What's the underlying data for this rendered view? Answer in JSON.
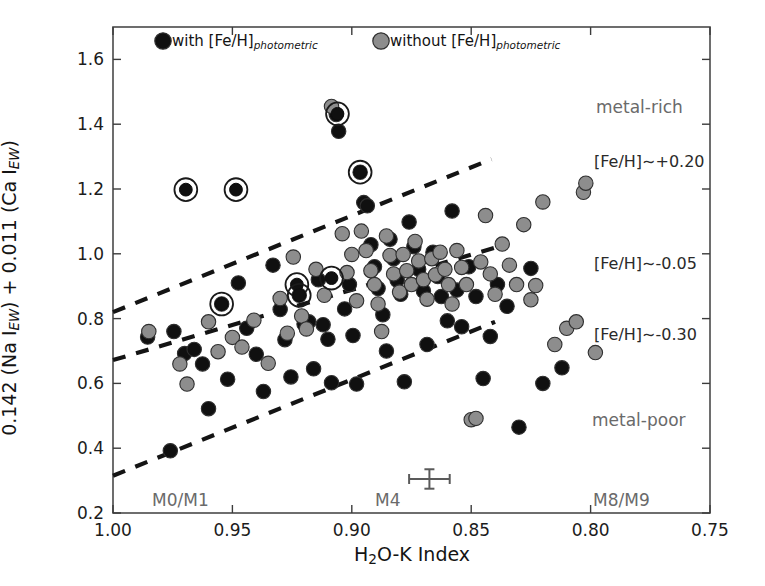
{
  "figure": {
    "background": "#ffffff",
    "frame_color": "#4a4a4a"
  },
  "axes": {
    "x_title_parts": {
      "pre": "H",
      "sub": "2",
      "post": "O-K Index"
    },
    "x_title_plain": "H2O-K Index",
    "y_title_plain": "0.142 (Na I_EW) + 0.011 (Ca I_EW)",
    "y_title_parts": {
      "a": "0.142 (Na I",
      "b": "EW",
      "c": ") + 0.011 (Ca I",
      "d": "EW",
      "e": ")"
    },
    "x_ticks": [
      "1.00",
      "0.95",
      "0.90",
      "0.85",
      "0.80",
      "0.75"
    ],
    "y_ticks": [
      "0.2",
      "0.4",
      "0.6",
      "0.8",
      "1.0",
      "1.2",
      "1.4",
      "1.6"
    ]
  },
  "legend": {
    "entries": [
      {
        "label_pre": "with [Fe/H]",
        "label_sub": "photometric",
        "marker": "black-filled-circle",
        "color": "#101010"
      },
      {
        "label_pre": "without [Fe/H]",
        "label_sub": "photometric",
        "marker": "gray-filled-circle",
        "color": "#8d8d8d"
      }
    ]
  },
  "annotations": [
    {
      "name": "metal-rich-label",
      "text": "metal-rich",
      "x": 596,
      "y": 97,
      "color": "#6a6a6a"
    },
    {
      "name": "metal-poor-label",
      "text": "metal-poor",
      "x": 592,
      "y": 410,
      "color": "#6a6a6a"
    },
    {
      "name": "spectral-m0m1-label",
      "text": "M0/M1",
      "x": 152,
      "y": 490,
      "color": "#6a6a6a"
    },
    {
      "name": "spectral-m4-label",
      "text": "M4",
      "x": 375,
      "y": 490,
      "color": "#6a6a6a"
    },
    {
      "name": "spectral-m8m9-label",
      "text": "M8/M9",
      "x": 593,
      "y": 490,
      "color": "#6a6a6a"
    },
    {
      "name": "feh-high-label",
      "text": "[Fe/H]∼+0.20",
      "x": 594,
      "y": 152,
      "color": "#2a2a2a"
    },
    {
      "name": "feh-mid-label",
      "text": "[Fe/H]∼-0.05",
      "x": 594,
      "y": 254,
      "color": "#2a2a2a"
    },
    {
      "name": "feh-low-label",
      "text": "[Fe/H]∼-0.30",
      "x": 594,
      "y": 325,
      "color": "#2a2a2a"
    }
  ],
  "errorbar": {
    "name": "typical-error-cross",
    "x": 0.8675,
    "y": 0.305,
    "xerr": 0.0085,
    "yerr": 0.03
  },
  "chart_data": {
    "type": "scatter",
    "title": "",
    "xlabel": "H2O-K Index",
    "ylabel": "0.142 (Na I_EW) + 0.011 (Ca I_EW)",
    "xlim": [
      1.0,
      0.75
    ],
    "ylim": [
      0.2,
      1.7
    ],
    "x_inverted": true,
    "grid": false,
    "legend_position": "top-inside",
    "xticks": [
      1.0,
      0.95,
      0.9,
      0.85,
      0.8,
      0.75
    ],
    "yticks": [
      0.2,
      0.4,
      0.6,
      0.8,
      1.0,
      1.2,
      1.4,
      1.6
    ],
    "series": [
      {
        "name": "with [Fe/H]photometric",
        "marker": "filled-circle",
        "color": "#101010",
        "points": [
          [
            0.9855,
            0.743
          ],
          [
            0.976,
            0.392
          ],
          [
            0.9745,
            0.76
          ],
          [
            0.97,
            0.692
          ],
          [
            0.966,
            0.705
          ],
          [
            0.9625,
            0.66
          ],
          [
            0.96,
            0.522
          ],
          [
            0.9545,
            0.845
          ],
          [
            0.952,
            0.613
          ],
          [
            0.9475,
            0.91
          ],
          [
            0.944,
            0.77
          ],
          [
            0.94,
            0.69
          ],
          [
            0.937,
            0.575
          ],
          [
            0.933,
            0.965
          ],
          [
            0.93,
            0.828
          ],
          [
            0.928,
            0.735
          ],
          [
            0.9255,
            0.62
          ],
          [
            0.922,
            0.872
          ],
          [
            0.92,
            0.783
          ],
          [
            0.918,
            0.79
          ],
          [
            0.916,
            0.645
          ],
          [
            0.914,
            0.92
          ],
          [
            0.912,
            0.781
          ],
          [
            0.91,
            0.736
          ],
          [
            0.9085,
            0.602
          ],
          [
            0.9065,
            1.43
          ],
          [
            0.9055,
            1.378
          ],
          [
            0.903,
            0.83
          ],
          [
            0.901,
            0.905
          ],
          [
            0.8995,
            0.748
          ],
          [
            0.898,
            0.598
          ],
          [
            0.8965,
            1.252
          ],
          [
            0.895,
            1.158
          ],
          [
            0.8935,
            1.148
          ],
          [
            0.892,
            1.028
          ],
          [
            0.8905,
            0.96
          ],
          [
            0.889,
            0.893
          ],
          [
            0.887,
            0.812
          ],
          [
            0.8855,
            0.7
          ],
          [
            0.884,
            1.045
          ],
          [
            0.8825,
            0.985
          ],
          [
            0.881,
            0.918
          ],
          [
            0.8795,
            0.875
          ],
          [
            0.878,
            0.605
          ],
          [
            0.876,
            1.098
          ],
          [
            0.874,
            1.022
          ],
          [
            0.872,
            0.952
          ],
          [
            0.87,
            0.885
          ],
          [
            0.8685,
            0.72
          ],
          [
            0.866,
            1.005
          ],
          [
            0.864,
            0.93
          ],
          [
            0.8625,
            0.868
          ],
          [
            0.86,
            0.793
          ],
          [
            0.858,
            1.132
          ],
          [
            0.856,
            0.888
          ],
          [
            0.854,
            0.775
          ],
          [
            0.851,
            0.96
          ],
          [
            0.848,
            0.868
          ],
          [
            0.845,
            0.615
          ],
          [
            0.842,
            0.745
          ],
          [
            0.839,
            0.905
          ],
          [
            0.835,
            0.838
          ],
          [
            0.83,
            0.465
          ],
          [
            0.825,
            0.955
          ],
          [
            0.82,
            0.6
          ],
          [
            0.812,
            0.648
          ]
        ]
      },
      {
        "name": "without [Fe/H]photometric",
        "marker": "filled-circle",
        "color": "#8d8d8d",
        "points": [
          [
            0.985,
            0.76
          ],
          [
            0.972,
            0.66
          ],
          [
            0.969,
            0.598
          ],
          [
            0.96,
            0.79
          ],
          [
            0.956,
            0.698
          ],
          [
            0.95,
            0.742
          ],
          [
            0.946,
            0.712
          ],
          [
            0.941,
            0.795
          ],
          [
            0.935,
            0.662
          ],
          [
            0.93,
            0.862
          ],
          [
            0.927,
            0.755
          ],
          [
            0.9245,
            0.99
          ],
          [
            0.921,
            0.808
          ],
          [
            0.919,
            0.768
          ],
          [
            0.915,
            0.952
          ],
          [
            0.9115,
            0.872
          ],
          [
            0.9085,
            1.455
          ],
          [
            0.904,
            1.062
          ],
          [
            0.902,
            0.942
          ],
          [
            0.9,
            0.998
          ],
          [
            0.898,
            0.855
          ],
          [
            0.896,
            1.07
          ],
          [
            0.894,
            1.01
          ],
          [
            0.892,
            0.948
          ],
          [
            0.8905,
            0.905
          ],
          [
            0.889,
            0.845
          ],
          [
            0.8875,
            0.76
          ],
          [
            0.8855,
            1.055
          ],
          [
            0.884,
            0.995
          ],
          [
            0.8825,
            0.938
          ],
          [
            0.88,
            0.882
          ],
          [
            0.8785,
            0.998
          ],
          [
            0.877,
            0.948
          ],
          [
            0.875,
            0.905
          ],
          [
            0.8735,
            1.038
          ],
          [
            0.872,
            0.978
          ],
          [
            0.87,
            0.92
          ],
          [
            0.8685,
            0.86
          ],
          [
            0.8665,
            0.985
          ],
          [
            0.865,
            0.935
          ],
          [
            0.863,
            1.005
          ],
          [
            0.861,
            0.952
          ],
          [
            0.8595,
            0.905
          ],
          [
            0.858,
            0.845
          ],
          [
            0.856,
            1.01
          ],
          [
            0.854,
            0.958
          ],
          [
            0.852,
            0.905
          ],
          [
            0.85,
            0.488
          ],
          [
            0.848,
            0.492
          ],
          [
            0.846,
            0.975
          ],
          [
            0.844,
            1.118
          ],
          [
            0.842,
            0.938
          ],
          [
            0.84,
            0.875
          ],
          [
            0.837,
            1.03
          ],
          [
            0.834,
            0.965
          ],
          [
            0.831,
            0.905
          ],
          [
            0.828,
            1.09
          ],
          [
            0.825,
            0.858
          ],
          [
            0.823,
            0.902
          ],
          [
            0.82,
            1.16
          ],
          [
            0.815,
            0.72
          ],
          [
            0.81,
            0.77
          ],
          [
            0.806,
            0.79
          ],
          [
            0.803,
            1.19
          ],
          [
            0.802,
            1.218
          ],
          [
            0.798,
            0.695
          ]
        ]
      },
      {
        "name": "circled-highlight",
        "marker": "circled-filled-circle",
        "color": "#101010",
        "points": [
          [
            0.9485,
            1.198
          ],
          [
            0.9695,
            1.198
          ],
          [
            0.9545,
            0.845
          ],
          [
            0.8965,
            1.252
          ],
          [
            0.906,
            1.432
          ],
          [
            0.923,
            0.905
          ],
          [
            0.922,
            0.872
          ],
          [
            0.9085,
            0.925
          ]
        ]
      }
    ],
    "trend_lines": [
      {
        "name": "feh-high-line",
        "label": "[Fe/H]~+0.20",
        "x1": 1.0,
        "y1": 0.82,
        "x2": 0.8415,
        "y2": 1.292,
        "style": "dashed",
        "color": "#141414"
      },
      {
        "name": "feh-mid-line",
        "label": "[Fe/H]~-0.05",
        "x1": 1.0,
        "y1": 0.672,
        "x2": 0.8395,
        "y2": 1.02,
        "style": "dashed",
        "color": "#141414"
      },
      {
        "name": "feh-low-line",
        "label": "[Fe/H]~-0.30",
        "x1": 1.0,
        "y1": 0.315,
        "x2": 0.84,
        "y2": 0.79,
        "style": "dashed",
        "color": "#141414"
      }
    ]
  }
}
